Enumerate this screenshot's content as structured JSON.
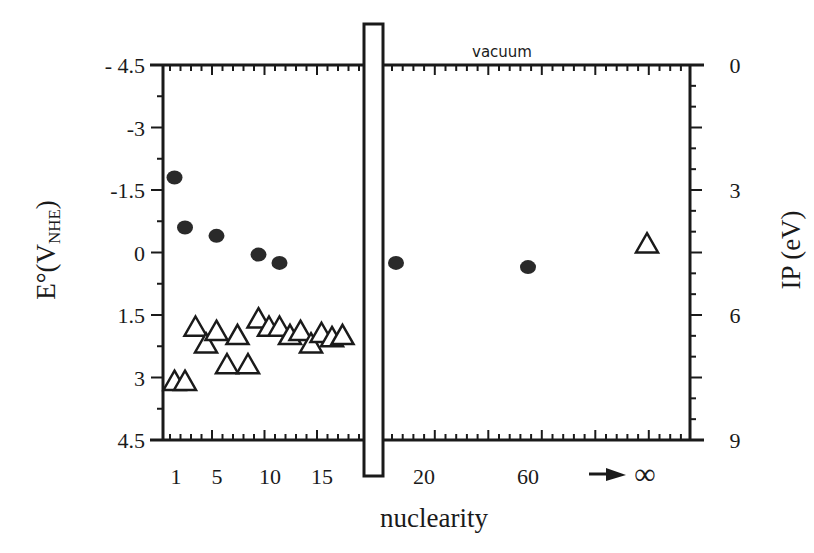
{
  "chart_data": {
    "type": "scatter",
    "title": "",
    "xlabel": "nuclearity",
    "ylabel_left": "E°(V_NHE)",
    "ylabel_left_main": "E°(V",
    "ylabel_left_sub": "NHE",
    "ylabel_left_close": ")",
    "ylabel_right": "IP (eV)",
    "annotation_top": "vacuum",
    "ylim_left": [
      -4.5,
      4.5
    ],
    "ylim_right": [
      0,
      9
    ],
    "yticks_left": [
      "- 4.5",
      "-3",
      "-1.5",
      "0",
      "1.5",
      "3",
      "4.5"
    ],
    "yticks_left_values": [
      -4.5,
      -3,
      -1.5,
      0,
      1.5,
      3,
      4.5
    ],
    "yticks_right": [
      "0",
      "3",
      "6",
      "9"
    ],
    "yticks_right_values": [
      0,
      3,
      6,
      9
    ],
    "xticks_left_panel": [
      "1",
      "5",
      "10",
      "15"
    ],
    "xticks_left_values": [
      1,
      5,
      10,
      15
    ],
    "xticks_right_panel": [
      "20",
      "60"
    ],
    "xtick_infinity": "∞",
    "axis_break": true,
    "grid": false,
    "legend": "none",
    "series": [
      {
        "name": "E° (filled circles, left axis)",
        "marker": "filled-circle",
        "points": [
          {
            "x": 1,
            "y": -1.8
          },
          {
            "x": 2,
            "y": -0.6
          },
          {
            "x": 5,
            "y": -0.4
          },
          {
            "x": 9,
            "y": 0.05
          },
          {
            "x": 11,
            "y": 0.25
          },
          {
            "x": 20,
            "y": 0.25
          },
          {
            "x": 60,
            "y": 0.35
          }
        ]
      },
      {
        "name": "IP (open triangles, right axis)",
        "marker": "open-triangle",
        "points": [
          {
            "x": 1,
            "y": 7.6
          },
          {
            "x": 2,
            "y": 7.6
          },
          {
            "x": 3,
            "y": 6.3
          },
          {
            "x": 4,
            "y": 6.7
          },
          {
            "x": 5,
            "y": 6.4
          },
          {
            "x": 6,
            "y": 7.2
          },
          {
            "x": 7,
            "y": 6.5
          },
          {
            "x": 8,
            "y": 7.2
          },
          {
            "x": 9,
            "y": 6.1
          },
          {
            "x": 10,
            "y": 6.3
          },
          {
            "x": 11,
            "y": 6.3
          },
          {
            "x": 12,
            "y": 6.5
          },
          {
            "x": 13,
            "y": 6.4
          },
          {
            "x": 14,
            "y": 6.7
          },
          {
            "x": 15,
            "y": 6.45
          },
          {
            "x": 16,
            "y": 6.55
          },
          {
            "x": 17,
            "y": 6.5
          },
          {
            "x": "∞",
            "y": 4.3
          }
        ]
      }
    ]
  }
}
